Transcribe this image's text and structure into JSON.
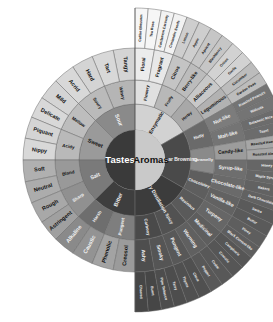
{
  "center": {
    "tastes_label": "Tastes",
    "aromas_label": "Aromas"
  },
  "colors": {
    "tastes_core": "#3a3a3a",
    "aromas_core": "#c9c9c9",
    "divider": "#555555"
  },
  "tastes": [
    {
      "label": "Sour",
      "color": "#8a8a8a",
      "children": [
        {
          "label": "Winey",
          "color": "#b5b5b5",
          "children": [
            {
              "label": "Tangy",
              "color": "#d4d4d4"
            },
            {
              "label": "Tart",
              "color": "#d8d8d8"
            }
          ]
        },
        {
          "label": "Soury",
          "color": "#bababa",
          "children": [
            {
              "label": "Hard",
              "color": "#d4d4d4"
            },
            {
              "label": "Acrid",
              "color": "#d8d8d8"
            }
          ]
        }
      ]
    },
    {
      "label": "Sweet",
      "color": "#9a9a9a",
      "children": [
        {
          "label": "Mellow",
          "color": "#bdbdbd",
          "children": [
            {
              "label": "Mild",
              "color": "#d4d4d4"
            },
            {
              "label": "Delicate",
              "color": "#d8d8d8"
            }
          ]
        },
        {
          "label": "Acidy",
          "color": "#b9b9b9",
          "children": [
            {
              "label": "Piquant",
              "color": "#d4d4d4"
            },
            {
              "label": "Nippy",
              "color": "#d8d8d8"
            }
          ]
        }
      ]
    },
    {
      "label": "Salt",
      "color": "#7a7a7a",
      "children": [
        {
          "label": "Bland",
          "color": "#999999",
          "children": [
            {
              "label": "Soft",
              "color": "#b0b0b0"
            },
            {
              "label": "Neutral",
              "color": "#acacac"
            }
          ]
        },
        {
          "label": "Sharp",
          "color": "#909090",
          "children": [
            {
              "label": "Rough",
              "color": "#a8a8a8"
            },
            {
              "label": "Astringent",
              "color": "#a0a0a0"
            }
          ]
        }
      ]
    },
    {
      "label": "Bitter",
      "color": "#3e3e3e",
      "children": [
        {
          "label": "Harsh",
          "color": "#6e6e6e",
          "children": [
            {
              "label": "Alkaline",
              "color": "#8a8a8a"
            },
            {
              "label": "Caustic",
              "color": "#939393"
            }
          ]
        },
        {
          "label": "Pungent",
          "color": "#7e7e7e",
          "children": [
            {
              "label": "Phenolic",
              "color": "#a3a3a3"
            },
            {
              "label": "Creosol",
              "color": "#9b9b9b"
            }
          ]
        }
      ]
    }
  ],
  "aromas": [
    {
      "label": "Enzymatic",
      "color": "#d2d2d2",
      "children": [
        {
          "label": "Flowery",
          "color": "#e0e0e0",
          "children": [
            {
              "label": "Floral",
              "color": "#ececec",
              "children": [
                {
                  "label": "Coffee Blossom"
                },
                {
                  "label": "Tea Rose"
                }
              ]
            },
            {
              "label": "Fragrant",
              "color": "#e8e8e8",
              "children": [
                {
                  "label": "Cardamon Caraway"
                },
                {
                  "label": "Coriander Seeds"
                }
              ]
            }
          ]
        },
        {
          "label": "Fruity",
          "color": "#b8b8b8",
          "children": [
            {
              "label": "Citrus",
              "color": "#c4c4c4",
              "children": [
                {
                  "label": "Lemon"
                },
                {
                  "label": "Apple"
                }
              ]
            },
            {
              "label": "Berry-like",
              "color": "#bcbcbc",
              "children": [
                {
                  "label": "Apricot"
                },
                {
                  "label": "Blackberry"
                }
              ]
            }
          ]
        },
        {
          "label": "Herby",
          "color": "#a8a8a8",
          "children": [
            {
              "label": "Alliaceous",
              "color": "#c8c8c8",
              "children": [
                {
                  "label": "Onion"
                },
                {
                  "label": "Garlic"
                }
              ]
            },
            {
              "label": "Leguminous",
              "color": "#b2b2b2",
              "children": [
                {
                  "label": "Cucumber"
                },
                {
                  "label": "Garden Peas"
                }
              ]
            }
          ]
        }
      ]
    },
    {
      "label": "Sugar Browning",
      "color": "#4a4a4a",
      "children": [
        {
          "label": "Nutty",
          "color": "#6a6a6a",
          "children": [
            {
              "label": "Nut-like",
              "color": "#7c7c7c",
              "children": [
                {
                  "label": "Roasted Peanuts"
                },
                {
                  "label": "Walnuts"
                }
              ]
            },
            {
              "label": "Malt-like",
              "color": "#747474",
              "children": [
                {
                  "label": "Balsamic Rice"
                },
                {
                  "label": "Toast"
                }
              ]
            }
          ]
        },
        {
          "label": "Caramelly",
          "color": "#8a8a8a",
          "children": [
            {
              "label": "Candy-like",
              "color": "#9c9c9c",
              "children": [
                {
                  "label": "Roasted Hazelnut"
                },
                {
                  "label": "Roasted Almond"
                }
              ]
            },
            {
              "label": "Syrup-like",
              "color": "#6e6e6e",
              "children": [
                {
                  "label": "Honey"
                },
                {
                  "label": "Maple Syrup"
                }
              ]
            }
          ]
        },
        {
          "label": "Chocolatey",
          "color": "#5e5e5e",
          "children": [
            {
              "label": "Chocolate-like",
              "color": "#6a6a6a",
              "children": [
                {
                  "label": "Bakers"
                },
                {
                  "label": "Dark Chocolate"
                }
              ]
            },
            {
              "label": "Vanilla-like",
              "color": "#626262",
              "children": [
                {
                  "label": "Swiss"
                },
                {
                  "label": "Butter"
                }
              ]
            }
          ]
        }
      ]
    },
    {
      "label": "Dry Distillation",
      "color": "#3c3c3c",
      "children": [
        {
          "label": "Resinous",
          "color": "#5a5a5a",
          "children": [
            {
              "label": "Turpeny",
              "color": "#666666",
              "children": [
                {
                  "label": "Piney"
                },
                {
                  "label": "Black Currant-like"
                }
              ]
            },
            {
              "label": "Medicinal",
              "color": "#5e5e5e",
              "children": [
                {
                  "label": "Camphoric"
                },
                {
                  "label": "Cineolic"
                }
              ]
            }
          ]
        },
        {
          "label": "Spicy",
          "color": "#525252",
          "children": [
            {
              "label": "Warming",
              "color": "#606060",
              "children": [
                {
                  "label": "Cedar"
                },
                {
                  "label": "Pepper"
                }
              ]
            },
            {
              "label": "Pungent",
              "color": "#585858",
              "children": [
                {
                  "label": "Clove"
                },
                {
                  "label": "Thyme"
                }
              ]
            }
          ]
        },
        {
          "label": "Carbony",
          "color": "#4a4a4a",
          "children": [
            {
              "label": "Smoky",
              "color": "#555555",
              "children": [
                {
                  "label": "Tarry"
                },
                {
                  "label": "Pipe Tobacco"
                }
              ]
            },
            {
              "label": "Ashy",
              "color": "#4e4e4e",
              "children": [
                {
                  "label": "Burnt"
                },
                {
                  "label": "Charred"
                }
              ]
            }
          ]
        }
      ]
    }
  ]
}
